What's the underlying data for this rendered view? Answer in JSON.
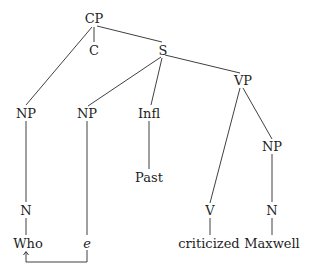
{
  "diagram": {
    "type": "syntax-tree",
    "nodes": {
      "cp": "CP",
      "c": "C",
      "s": "S",
      "vp": "VP",
      "np_wh": "NP",
      "np_subj": "NP",
      "infl": "Infl",
      "np_obj": "NP",
      "past": "Past",
      "n_wh": "N",
      "v": "V",
      "n_obj": "N",
      "who": "Who",
      "e": "e",
      "criticized": "criticized",
      "maxwell": "Maxwell"
    },
    "movement_arrow": {
      "from": "e",
      "to": "Who"
    },
    "colors": {
      "line": "#2a2a2a",
      "text": "#1e1e1e",
      "background": "#ffffff"
    }
  }
}
